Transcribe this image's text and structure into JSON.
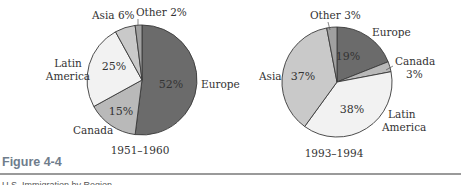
{
  "chart_data": [
    {
      "type": "pie",
      "title": "1951–1960",
      "start_angle_deg": 0,
      "direction": "clockwise",
      "slices": [
        {
          "label": "Europe",
          "value": 52,
          "color": "#6b6b6b",
          "pct_label": "52%"
        },
        {
          "label": "Canada",
          "value": 15,
          "color": "#b9b9b9",
          "pct_label": "15%"
        },
        {
          "label": "Latin America",
          "value": 25,
          "color": "#f2f2f2",
          "pct_label": "25%"
        },
        {
          "label": "Asia",
          "value": 6,
          "color": "#c9c9c9",
          "pct_label": "6%"
        },
        {
          "label": "Other",
          "value": 2,
          "color": "#a0a0a0",
          "pct_label": "2%"
        }
      ]
    },
    {
      "type": "pie",
      "title": "1993–1994",
      "start_angle_deg": 0,
      "direction": "clockwise",
      "slices": [
        {
          "label": "Europe",
          "value": 19,
          "color": "#6b6b6b",
          "pct_label": "19%"
        },
        {
          "label": "Canada",
          "value": 3,
          "color": "#b9b9b9",
          "pct_label": "3%"
        },
        {
          "label": "Latin America",
          "value": 38,
          "color": "#f2f2f2",
          "pct_label": "38%"
        },
        {
          "label": "Asia",
          "value": 37,
          "color": "#c9c9c9",
          "pct_label": "37%"
        },
        {
          "label": "Other",
          "value": 3,
          "color": "#a0a0a0",
          "pct_label": "3%"
        }
      ]
    }
  ],
  "labels": {
    "pie1": {
      "asia": "Asia 6%",
      "other": "Other 2%",
      "latin_line1": "Latin",
      "latin_line2": "America",
      "europe": "Europe",
      "canada": "Canada",
      "caption": "1951–1960"
    },
    "pie2": {
      "other": "Other 3%",
      "europe": "Europe",
      "canada_line1": "Canada",
      "canada_line2": "3%",
      "asia": "Asia",
      "latin_line1": "Latin",
      "latin_line2": "America",
      "caption": "1993–1994"
    }
  },
  "figure": {
    "title": "Figure 4-4",
    "cutoff_text": "U.S. Immigration by Region"
  }
}
